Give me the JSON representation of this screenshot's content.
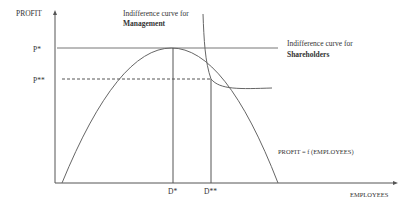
{
  "diagram": {
    "y_axis_label": "PROFIT",
    "x_axis_label": "EMPLOYEES",
    "p_star_label": "P*",
    "p_double_star_label": "P**",
    "d_star_label": "D*",
    "d_double_star_label": "D**",
    "management_curve_label_line1": "Indifference curve for",
    "management_curve_label_line2": "Management",
    "shareholders_curve_label_line1": "Indifference curve for",
    "shareholders_curve_label_line2": "Shareholders",
    "function_label": "PROFIT = f (EMPLOYEES)",
    "colors": {
      "line": "#555555",
      "text": "#333333"
    }
  }
}
